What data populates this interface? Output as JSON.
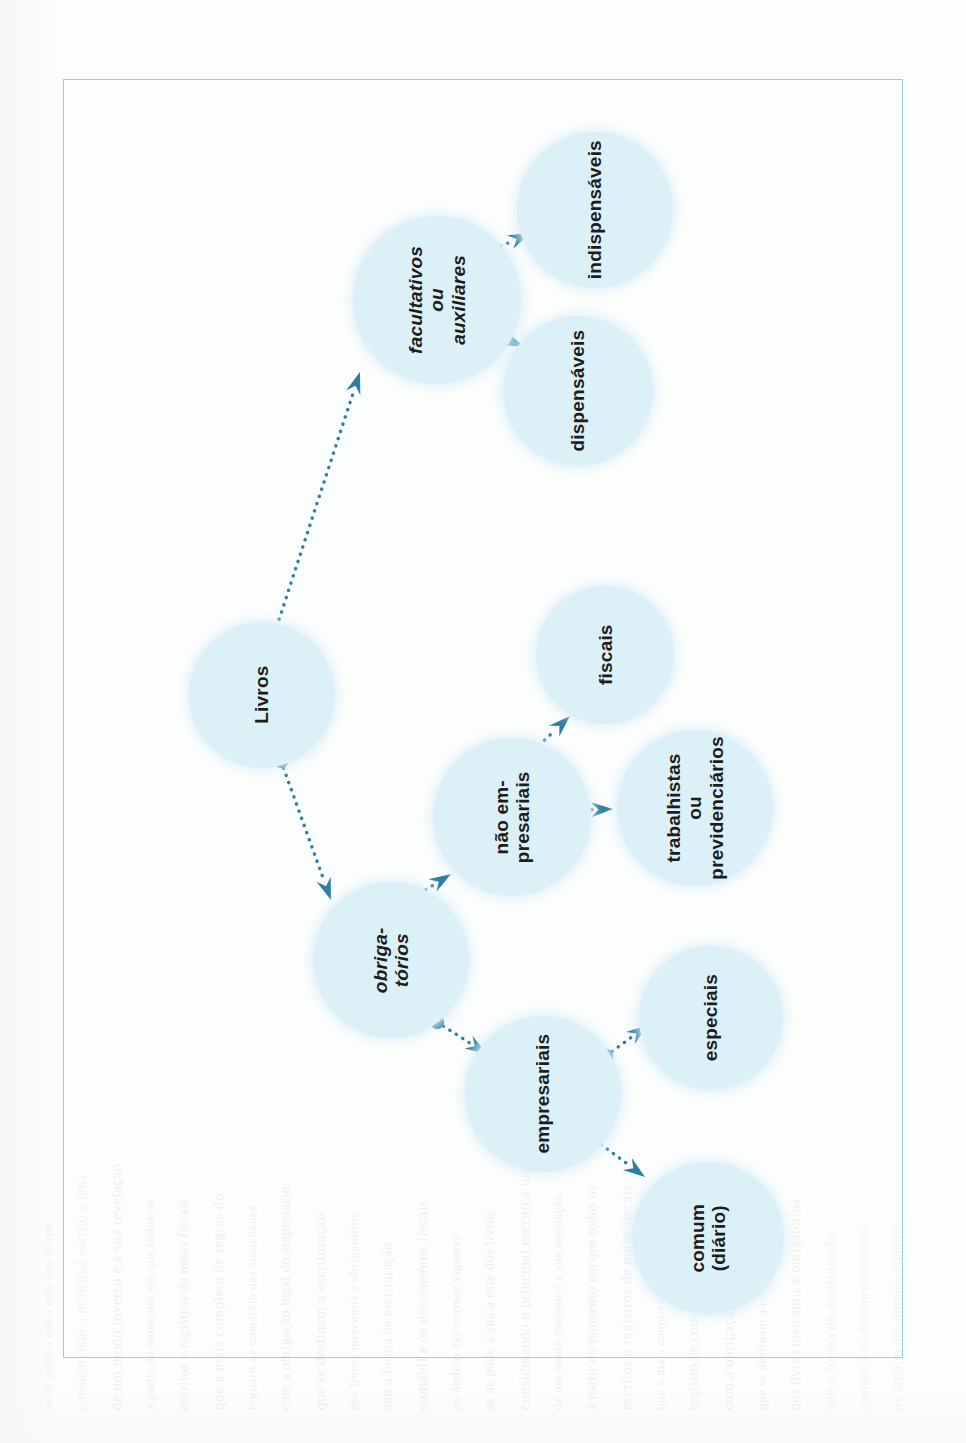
{
  "document": {
    "type": "diagram",
    "language": "pt-BR",
    "title": "Livros",
    "frame_color": "#9fcbe0",
    "node_fill": "#dcf0f8",
    "connector_color": "#2e7fa5",
    "text_color": "#1d1d1b",
    "text_orientation": "rotated-90-ccw"
  },
  "nodes": [
    {
      "id": "livros",
      "label": "Livros",
      "italic": false,
      "cx": 262,
      "cy": 695,
      "r": 73
    },
    {
      "id": "facultativos",
      "label": "facultativos\nou\nauxiliares",
      "italic": true,
      "cx": 437,
      "cy": 300,
      "r": 84
    },
    {
      "id": "indispensaveis",
      "label": "indispensáveis",
      "italic": false,
      "cx": 595,
      "cy": 210,
      "r": 78
    },
    {
      "id": "dispensaveis",
      "label": "dispensáveis",
      "italic": false,
      "cx": 578,
      "cy": 391,
      "r": 75
    },
    {
      "id": "obrigatorios",
      "label": "obriga-\ntórios",
      "italic": true,
      "cx": 391,
      "cy": 960,
      "r": 78
    },
    {
      "id": "nao_empresariais",
      "label": "não em-\npresariais",
      "italic": false,
      "cx": 512,
      "cy": 817,
      "r": 79
    },
    {
      "id": "fiscais",
      "label": "fiscais",
      "italic": false,
      "cx": 605,
      "cy": 655,
      "r": 69
    },
    {
      "id": "trabalhistas",
      "label": "trabalhistas\nou\nprevidenciários",
      "italic": false,
      "cx": 695,
      "cy": 808,
      "r": 78
    },
    {
      "id": "empresariais",
      "label": "empresariais",
      "italic": false,
      "cx": 543,
      "cy": 1094,
      "r": 78
    },
    {
      "id": "especiais",
      "label": "especiais",
      "italic": false,
      "cx": 711,
      "cy": 1018,
      "r": 72
    },
    {
      "id": "comum",
      "label": "comum\n(diário)",
      "italic": false,
      "cx": 708,
      "cy": 1238,
      "r": 76
    }
  ],
  "edges": [
    {
      "from": "livros",
      "to": "facultativos",
      "x1": 272,
      "y1": 641,
      "x2": 360,
      "y2": 372
    },
    {
      "from": "facultativos",
      "to": "indispensaveis",
      "x1": 473,
      "y1": 259,
      "x2": 530,
      "y2": 233
    },
    {
      "from": "facultativos",
      "to": "dispensaveis",
      "x1": 474,
      "y1": 325,
      "x2": 524,
      "y2": 347
    },
    {
      "from": "livros",
      "to": "obrigatorios",
      "x1": 281,
      "y1": 761,
      "x2": 331,
      "y2": 900
    },
    {
      "from": "obrigatorios",
      "to": "nao_empresariais",
      "x1": 400,
      "y1": 906,
      "x2": 451,
      "y2": 874
    },
    {
      "from": "nao_empresariais",
      "to": "fiscais",
      "x1": 528,
      "y1": 756,
      "x2": 570,
      "y2": 716
    },
    {
      "from": "nao_empresariais",
      "to": "trabalhistas",
      "x1": 554,
      "y1": 811,
      "x2": 613,
      "y2": 809
    },
    {
      "from": "obrigatorios",
      "to": "empresariais",
      "x1": 437,
      "y1": 1022,
      "x2": 487,
      "y2": 1054
    },
    {
      "from": "empresariais",
      "to": "especiais",
      "x1": 606,
      "y1": 1056,
      "x2": 648,
      "y2": 1025
    },
    {
      "from": "empresariais",
      "to": "comum",
      "x1": 595,
      "y1": 1140,
      "x2": 645,
      "y2": 1177
    }
  ],
  "background_bleed": {
    "note": "faint mirrored text showing through from reverse page",
    "lines": [
      "se as pode a sua a este dos livros",
      "considerando o principal escrito a uma",
      "de um modo inverso e a sua revelação",
      "a partir do momento em que todos os",
      "escritos e registros de notas fiscais",
      "que a mais completo de regras do",
      "registro de comércio das sociedades",
      "com a obrigação legal do empresário",
      "que se destinam a escrituração",
      "dos livros mercantis e obrigatórios",
      "sob a forma de escrituração",
      "contábil e os documentos fiscais",
      "no âmbito das normas vigentes"
    ]
  }
}
